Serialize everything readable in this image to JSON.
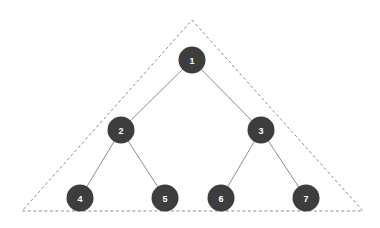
{
  "diagram": {
    "background_color": "#ffffff",
    "canvas": {
      "width": 380,
      "height": 228
    },
    "node_style": {
      "fill_color": "#3d3d3d",
      "label_color": "#ffffff",
      "radius": 13.5
    },
    "edge_style": {
      "color": "#808080",
      "width": 0.9
    },
    "boundary_style": {
      "color": "#8d8d8d",
      "width": 1,
      "dash_pattern": "3 2.5",
      "shape": "triangle"
    },
    "nodes": [
      {
        "id": "n1",
        "label": "1",
        "x": 192,
        "y": 60,
        "level": 0
      },
      {
        "id": "n2",
        "label": "2",
        "x": 121,
        "y": 130,
        "level": 1
      },
      {
        "id": "n3",
        "label": "3",
        "x": 261,
        "y": 130,
        "level": 1
      },
      {
        "id": "n4",
        "label": "4",
        "x": 80,
        "y": 198,
        "level": 2
      },
      {
        "id": "n5",
        "label": "5",
        "x": 165,
        "y": 198,
        "level": 2
      },
      {
        "id": "n6",
        "label": "6",
        "x": 221,
        "y": 198,
        "level": 2
      },
      {
        "id": "n7",
        "label": "7",
        "x": 306,
        "y": 198,
        "level": 2
      }
    ],
    "edges": [
      {
        "id": "e1",
        "from": "n1",
        "to": "n2",
        "x1": 192,
        "y1": 60,
        "x2": 121,
        "y2": 130
      },
      {
        "id": "e2",
        "from": "n1",
        "to": "n3",
        "x1": 192,
        "y1": 60,
        "x2": 261,
        "y2": 130
      },
      {
        "id": "e3",
        "from": "n2",
        "to": "n4",
        "x1": 121,
        "y1": 130,
        "x2": 80,
        "y2": 198
      },
      {
        "id": "e4",
        "from": "n2",
        "to": "n5",
        "x1": 121,
        "y1": 130,
        "x2": 165,
        "y2": 198
      },
      {
        "id": "e5",
        "from": "n3",
        "to": "n6",
        "x1": 261,
        "y1": 130,
        "x2": 221,
        "y2": 198
      },
      {
        "id": "e6",
        "from": "n3",
        "to": "n7",
        "x1": 261,
        "y1": 130,
        "x2": 306,
        "y2": 198
      }
    ],
    "boundary": {
      "apex": {
        "x": 192,
        "y": 20
      },
      "bottom_left": {
        "x": 22,
        "y": 211
      },
      "bottom_right": {
        "x": 363,
        "y": 211
      },
      "points": "192,20 363,211 22,211 192,20"
    }
  }
}
